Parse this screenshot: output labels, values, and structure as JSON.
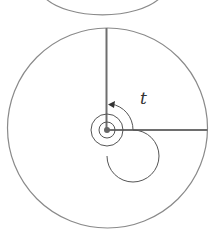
{
  "diagram": {
    "angle_label": "t",
    "colors": {
      "circle_stroke": "#8a8a8a",
      "radius_stroke": "#6e6e6e",
      "spiral_stroke": "#555555",
      "center_dot": "#666666",
      "background": "#ffffff"
    },
    "elements": [
      {
        "type": "circle-arc",
        "description": "bottom of upper circle (partially visible)"
      },
      {
        "type": "circle",
        "description": "large circle"
      },
      {
        "type": "radius-line",
        "direction": "up"
      },
      {
        "type": "radius-line",
        "direction": "right"
      },
      {
        "type": "spiral",
        "description": "angle spiral from right radius counter-clockwise to vertical radius with arrowhead"
      },
      {
        "type": "point",
        "description": "center point"
      }
    ]
  }
}
